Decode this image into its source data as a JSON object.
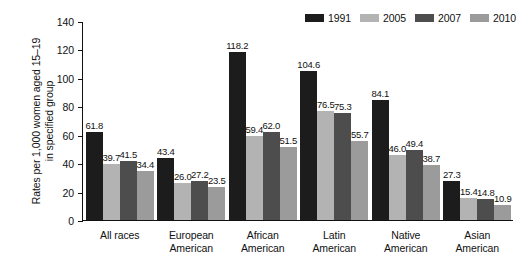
{
  "chart_data": {
    "type": "bar",
    "title": "",
    "xlabel": "",
    "ylabel": "Rates per 1,000 women aged 15–19 in specified group",
    "ylabel_lines": [
      "Rates per 1,000 women aged 15–19",
      "in specified group"
    ],
    "ylim": [
      0,
      140
    ],
    "yticks": [
      0,
      20,
      40,
      60,
      80,
      100,
      120,
      140
    ],
    "ytick_labels": [
      "0",
      "20",
      "40",
      "60",
      "80",
      "100",
      "120",
      "140"
    ],
    "grid": false,
    "legend_position": "top-right",
    "categories": [
      "All races",
      "European American",
      "African American",
      "Latin American",
      "Native American",
      "Asian American"
    ],
    "category_lines": [
      [
        "All races"
      ],
      [
        "European",
        "American"
      ],
      [
        "African",
        "American"
      ],
      [
        "Latin",
        "American"
      ],
      [
        "Native",
        "American"
      ],
      [
        "Asian",
        "American"
      ]
    ],
    "series": [
      {
        "name": "1991",
        "color": "#1c1c1c",
        "values": [
          61.8,
          43.4,
          118.2,
          104.6,
          84.1,
          27.3
        ],
        "labels": [
          "61.8",
          "43.4",
          "118.2",
          "104.6",
          "84.1",
          "27.3"
        ]
      },
      {
        "name": "2005",
        "color": "#b3b3b3",
        "values": [
          39.7,
          26.0,
          59.4,
          76.5,
          46.0,
          15.4
        ],
        "labels": [
          "39.7",
          "26.0",
          "59.4",
          "76.5",
          "46.0",
          "15.4"
        ]
      },
      {
        "name": "2007",
        "color": "#4d4d4d",
        "values": [
          41.5,
          27.2,
          62.0,
          75.3,
          49.4,
          14.8
        ],
        "labels": [
          "41.5",
          "27.2",
          "62.0",
          "75.3",
          "49.4",
          "14.8"
        ]
      },
      {
        "name": "2010",
        "color": "#9b9b9b",
        "values": [
          34.4,
          23.5,
          51.5,
          55.7,
          38.7,
          10.9
        ],
        "labels": [
          "34.4",
          "23.5",
          "51.5",
          "55.7",
          "38.7",
          "10.9"
        ]
      }
    ]
  }
}
